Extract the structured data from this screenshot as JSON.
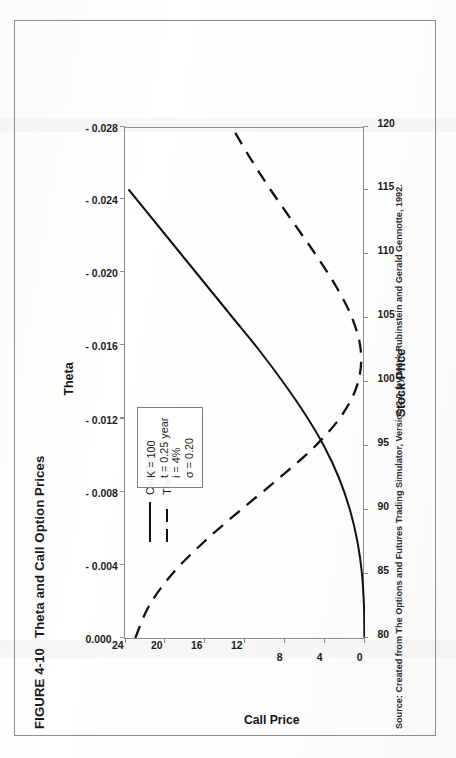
{
  "figure": {
    "number": "FIGURE 4-10",
    "title": "Theta and Call Option Prices",
    "source": "Source: Created from The Options and Futures Trading Simulator, Version 2.0, by Mark Rubinstein and Gerald Gennotte, 1992."
  },
  "legend": {
    "items": [
      {
        "label": "Call Price",
        "style": "solid"
      },
      {
        "label": "Theta",
        "style": "dashed"
      }
    ]
  },
  "params": {
    "lines": [
      "K = 100",
      "t = 0.25 year",
      "i = 4%",
      "σ = 0.20"
    ]
  },
  "colors": {
    "ink": "#111111",
    "frame": "#8a8a8a",
    "page_border": "#8d8d8d",
    "background": "#ffffff"
  },
  "chart_data": {
    "type": "line",
    "title": "Theta and Call Option Prices",
    "xlabel": "Stock Price",
    "ylabel": "Call Price",
    "y2label": "Theta",
    "grid": false,
    "legend_position": "inside-upper-left",
    "xlim": [
      80,
      120
    ],
    "ylim": [
      0,
      24
    ],
    "y2lim": [
      0.0,
      -0.028
    ],
    "xticks": [
      80,
      85,
      90,
      95,
      100,
      105,
      110,
      115,
      120
    ],
    "yticks": [
      0,
      4,
      8,
      12,
      16,
      20,
      24
    ],
    "y2ticks": [
      "0.000",
      "- 0.004",
      "- 0.008",
      "- 0.012",
      "- 0.016",
      "- 0.020",
      "- 0.024",
      "- 0.028"
    ],
    "y2tick_values": [
      0.0,
      -0.004,
      -0.008,
      -0.012,
      -0.016,
      -0.02,
      -0.024,
      -0.028
    ],
    "x": [
      80,
      82.5,
      85,
      87.5,
      90,
      92.5,
      95,
      97.5,
      100,
      102.5,
      105,
      107.5,
      110,
      112.5,
      115,
      117.5,
      120
    ],
    "series": [
      {
        "name": "Call Price",
        "axis": "left",
        "style": "solid",
        "values": [
          0.02,
          0.1,
          0.3,
          0.75,
          1.5,
          2.6,
          4.1,
          6.0,
          8.2,
          10.6,
          13.2,
          15.8,
          18.4,
          21.0,
          23.6,
          26.2,
          28.8
        ]
      },
      {
        "name": "Theta",
        "axis": "right",
        "style": "dashed",
        "values": [
          -0.0012,
          -0.0028,
          -0.0055,
          -0.0092,
          -0.0135,
          -0.018,
          -0.0222,
          -0.0254,
          -0.0272,
          -0.0275,
          -0.0265,
          -0.0246,
          -0.0222,
          -0.0196,
          -0.017,
          -0.0146,
          -0.0124
        ]
      }
    ],
    "annotations": [
      "K = 100",
      "t = 0.25 year",
      "i = 4%",
      "σ = 0.20"
    ]
  }
}
